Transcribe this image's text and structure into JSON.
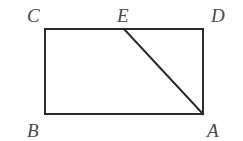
{
  "figure": {
    "type": "geometry-diagram",
    "canvas": {
      "width": 243,
      "height": 141,
      "background": "#ffffff"
    },
    "stroke": {
      "color": "#2b2b2b",
      "width": 2
    },
    "label_color": "#4a4a4a",
    "rectangle": {
      "name": "rectangle-BCDA",
      "left": 45,
      "top": 29,
      "right": 203,
      "bottom": 114
    },
    "points": [
      {
        "id": "C",
        "label": "C",
        "x": 45,
        "y": 29,
        "label_x": 27,
        "label_y": 6
      },
      {
        "id": "E",
        "label": "E",
        "x": 124,
        "y": 29,
        "label_x": 117,
        "label_y": 6
      },
      {
        "id": "D",
        "label": "D",
        "x": 203,
        "y": 29,
        "label_x": 211,
        "label_y": 6
      },
      {
        "id": "B",
        "label": "B",
        "x": 45,
        "y": 114,
        "label_x": 27,
        "label_y": 121
      },
      {
        "id": "A",
        "label": "A",
        "x": 203,
        "y": 114,
        "label_x": 207,
        "label_y": 121
      }
    ],
    "segments": [
      {
        "id": "CD",
        "name": "top-edge",
        "x1": 45,
        "y1": 29,
        "x2": 203,
        "y2": 29
      },
      {
        "id": "DA",
        "name": "right-edge",
        "x1": 203,
        "y1": 29,
        "x2": 203,
        "y2": 114
      },
      {
        "id": "AB",
        "name": "bottom-edge",
        "x1": 203,
        "y1": 114,
        "x2": 45,
        "y2": 114
      },
      {
        "id": "BC",
        "name": "left-edge",
        "x1": 45,
        "y1": 114,
        "x2": 45,
        "y2": 29
      },
      {
        "id": "EA",
        "name": "diagonal-E-to-A",
        "x1": 124,
        "y1": 29,
        "x2": 203,
        "y2": 114
      }
    ]
  }
}
